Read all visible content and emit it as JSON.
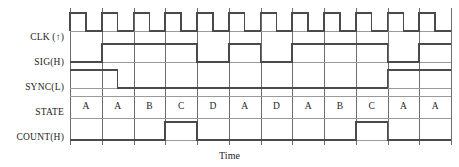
{
  "diagram": {
    "title_axis": "Time",
    "signal_labels": [
      {
        "name": "clk",
        "text": "CLK (↑)"
      },
      {
        "name": "sig",
        "text": "SIG(H)"
      },
      {
        "name": "sync",
        "text": "SYNC(L)"
      },
      {
        "name": "state",
        "text": "STATE"
      },
      {
        "name": "count",
        "text": "COUNT(H)"
      }
    ],
    "states": [
      "A",
      "A",
      "B",
      "C",
      "D",
      "A",
      "D",
      "A",
      "B",
      "C",
      "A",
      "A"
    ],
    "colors": {
      "waveform": "#4a4a4a",
      "gridline": "#6b6b6b",
      "background": "#ffffff",
      "text": "#1c1c1c"
    },
    "chart_data": {
      "type": "line",
      "title": "",
      "xlabel": "Time",
      "ylabel": "",
      "grid": true,
      "legend": "none",
      "x_divisions": 12,
      "series": [
        {
          "name": "CLK (↑)",
          "type": "digital",
          "description": "Periodic clock; rising edge at the start of each of 12 time divisions, high for the first half of each division, low for the second half.",
          "values": [
            1,
            0,
            1,
            0,
            1,
            0,
            1,
            0,
            1,
            0,
            1,
            0,
            1,
            0,
            1,
            0,
            1,
            0,
            1,
            0,
            1,
            0,
            1,
            0
          ]
        },
        {
          "name": "SIG(H)",
          "type": "digital",
          "description": "Active-high input signal sampled by the state machine.",
          "transitions": [
            {
              "division": 0.0,
              "level": 0
            },
            {
              "division": 1.0,
              "level": 1
            },
            {
              "division": 4.0,
              "level": 0
            },
            {
              "division": 5.0,
              "level": 1
            },
            {
              "division": 6.0,
              "level": 0
            },
            {
              "division": 7.0,
              "level": 1
            },
            {
              "division": 10.0,
              "level": 0
            },
            {
              "division": 11.0,
              "level": 1
            }
          ]
        },
        {
          "name": "SYNC(L)",
          "type": "digital",
          "description": "Active-low synchronization signal; asserted (low) for most of the sequence.",
          "transitions": [
            {
              "division": 0.0,
              "level": 1
            },
            {
              "division": 1.5,
              "level": 0
            },
            {
              "division": 10.0,
              "level": 1
            }
          ]
        },
        {
          "name": "COUNT(H)",
          "type": "digital",
          "description": "Count enable pulse, high only while STATE is C.",
          "transitions": [
            {
              "division": 0.0,
              "level": 0
            },
            {
              "division": 3.0,
              "level": 1
            },
            {
              "division": 4.0,
              "level": 0
            },
            {
              "division": 9.0,
              "level": 1
            },
            {
              "division": 10.0,
              "level": 0
            }
          ]
        }
      ],
      "state_track": {
        "name": "STATE",
        "categories": [
          "A",
          "A",
          "B",
          "C",
          "D",
          "A",
          "D",
          "A",
          "B",
          "C",
          "A",
          "A"
        ]
      }
    }
  }
}
